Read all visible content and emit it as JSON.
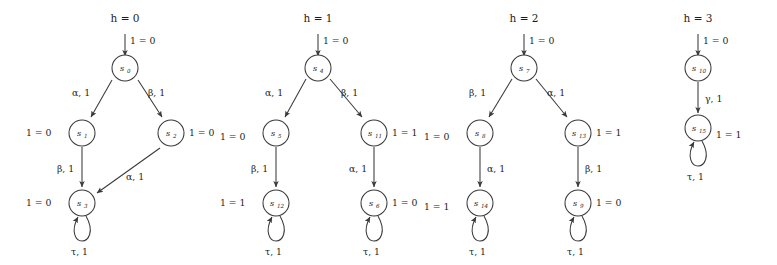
{
  "figure": {
    "type": "state-transition-diagram",
    "width": 777,
    "height": 265,
    "background": "#ffffff",
    "stroke_color": "#3a3a3a",
    "text_color": "#1d1d1d"
  },
  "clusters": [
    {
      "id": "cluster-h0",
      "title": "h = 0",
      "entry_label": "1 = 0",
      "nodes": [
        {
          "id": "s0",
          "name": "s",
          "sub": "0",
          "side_label": "",
          "side": "none",
          "self_loop": false,
          "loop_label": ""
        },
        {
          "id": "s1",
          "name": "s",
          "sub": "1",
          "side_label": "1 = 0",
          "side": "left",
          "self_loop": false,
          "loop_label": ""
        },
        {
          "id": "s2",
          "name": "s",
          "sub": "2",
          "side_label": "1 = 0",
          "side": "right",
          "self_loop": false,
          "loop_label": ""
        },
        {
          "id": "s3",
          "name": "s",
          "sub": "3",
          "side_label": "1 = 0",
          "side": "left",
          "self_loop": true,
          "loop_label": "τ, 1"
        }
      ],
      "edges": [
        {
          "from": "s0",
          "to": "s1",
          "label": "α, 1"
        },
        {
          "from": "s0",
          "to": "s2",
          "label": "β, 1"
        },
        {
          "from": "s1",
          "to": "s3",
          "label": "β, 1"
        },
        {
          "from": "s2",
          "to": "s3",
          "label": "α, 1"
        }
      ]
    },
    {
      "id": "cluster-h1",
      "title": "h = 1",
      "entry_label": "1 = 0",
      "nodes": [
        {
          "id": "s4",
          "name": "s",
          "sub": "4",
          "side_label": "",
          "side": "none",
          "self_loop": false,
          "loop_label": ""
        },
        {
          "id": "s5",
          "name": "s",
          "sub": "5",
          "side_label": "1 = 0",
          "side": "left",
          "self_loop": false,
          "loop_label": ""
        },
        {
          "id": "s11",
          "name": "s",
          "sub": "11",
          "side_label": "1 = 1",
          "side": "right",
          "self_loop": false,
          "loop_label": ""
        },
        {
          "id": "s12",
          "name": "s",
          "sub": "12",
          "side_label": "1 = 1",
          "side": "left",
          "self_loop": true,
          "loop_label": "τ, 1"
        },
        {
          "id": "s6",
          "name": "s",
          "sub": "6",
          "side_label": "1 = 0",
          "side": "right",
          "self_loop": true,
          "loop_label": "τ, 1"
        }
      ],
      "edges": [
        {
          "from": "s4",
          "to": "s5",
          "label": "α, 1"
        },
        {
          "from": "s4",
          "to": "s11",
          "label": "β, 1"
        },
        {
          "from": "s5",
          "to": "s12",
          "label": "β, 1"
        },
        {
          "from": "s11",
          "to": "s6",
          "label": "α, 1"
        }
      ]
    },
    {
      "id": "cluster-h2",
      "title": "h = 2",
      "entry_label": "1 = 0",
      "nodes": [
        {
          "id": "s7",
          "name": "s",
          "sub": "7",
          "side_label": "",
          "side": "none",
          "self_loop": false,
          "loop_label": ""
        },
        {
          "id": "s8",
          "name": "s",
          "sub": "8",
          "side_label": "1 = 0",
          "side": "left",
          "self_loop": false,
          "loop_label": ""
        },
        {
          "id": "s13",
          "name": "s",
          "sub": "13",
          "side_label": "1 = 1",
          "side": "right",
          "self_loop": false,
          "loop_label": ""
        },
        {
          "id": "s14",
          "name": "s",
          "sub": "14",
          "side_label": "1 = 1",
          "side": "left",
          "self_loop": true,
          "loop_label": "τ, 1"
        },
        {
          "id": "s9",
          "name": "s",
          "sub": "9",
          "side_label": "1 = 0",
          "side": "right",
          "self_loop": true,
          "loop_label": "τ, 1"
        }
      ],
      "edges": [
        {
          "from": "s7",
          "to": "s8",
          "label": "β, 1"
        },
        {
          "from": "s7",
          "to": "s13",
          "label": "α, 1"
        },
        {
          "from": "s8",
          "to": "s14",
          "label": "α, 1"
        },
        {
          "from": "s13",
          "to": "s9",
          "label": "β, 1"
        }
      ]
    },
    {
      "id": "cluster-h3",
      "title": "h = 3",
      "entry_label": "1 = 0",
      "nodes": [
        {
          "id": "s10",
          "name": "s",
          "sub": "10",
          "side_label": "",
          "side": "none",
          "self_loop": false,
          "loop_label": ""
        },
        {
          "id": "s15",
          "name": "s",
          "sub": "15",
          "side_label": "1 = 1",
          "side": "right",
          "self_loop": true,
          "loop_label": "τ, 1"
        }
      ],
      "edges": [
        {
          "from": "s10",
          "to": "s15",
          "label": "γ, 1"
        }
      ]
    }
  ],
  "labels": {
    "c0": {
      "title": "h = 0",
      "entry": "1 = 0",
      "s0": "s",
      "s0sub": "0",
      "s1": "s",
      "s1sub": "1",
      "s1side": "1 = 0",
      "s2": "s",
      "s2sub": "2",
      "s2side": "1 = 0",
      "s3": "s",
      "s3sub": "3",
      "s3side": "1 = 0",
      "s3loop": "τ, 1",
      "e01": "α, 1",
      "e02": "β, 1",
      "e13": "β, 1",
      "e23": "α, 1"
    },
    "c1": {
      "title": "h = 1",
      "entry": "1 = 0",
      "s4": "s",
      "s4sub": "4",
      "s5": "s",
      "s5sub": "5",
      "s5side": "1 = 0",
      "s11": "s",
      "s11sub": "11",
      "s11side": "1 = 1",
      "s12": "s",
      "s12sub": "12",
      "s12side": "1 = 1",
      "s12loop": "τ, 1",
      "s6": "s",
      "s6sub": "6",
      "s6side": "1 = 0",
      "s6loop": "τ, 1",
      "e45": "α, 1",
      "e411": "β, 1",
      "e512": "β, 1",
      "e116": "α, 1"
    },
    "c2": {
      "title": "h = 2",
      "entry": "1 = 0",
      "s7": "s",
      "s7sub": "7",
      "s8": "s",
      "s8sub": "8",
      "s8side": "1 = 0",
      "s13": "s",
      "s13sub": "13",
      "s13side": "1 = 1",
      "s14": "s",
      "s14sub": "14",
      "s14side": "1 = 1",
      "s14loop": "τ, 1",
      "s9": "s",
      "s9sub": "9",
      "s9side": "1 = 0",
      "s9loop": "τ, 1",
      "e78": "β, 1",
      "e713": "α, 1",
      "e814": "α, 1",
      "e139": "β, 1"
    },
    "c3": {
      "title": "h = 3",
      "entry": "1 = 0",
      "s10": "s",
      "s10sub": "10",
      "s15": "s",
      "s15sub": "15",
      "s15side": "1 = 1",
      "s15loop": "τ, 1",
      "e1015": "γ, 1"
    }
  }
}
